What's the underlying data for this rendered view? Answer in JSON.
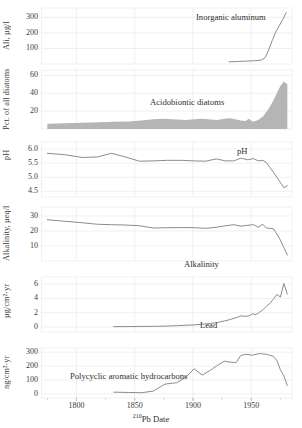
{
  "figure": {
    "xaxis_label_sup": "210",
    "xaxis_label_main": "Pb Date",
    "xlim": [
      1770,
      1985
    ],
    "xticks": [
      1800,
      1850,
      1900,
      1950
    ],
    "xtick_labels": [
      "1800",
      "1850",
      "1900",
      "1950"
    ],
    "grid_color": "#e6e6e6",
    "line_color": "#8c8c8c",
    "fill_color": "#b5b5b5",
    "text_color": "#3a3a3a"
  },
  "chart_data": [
    {
      "type": "line",
      "panel": 1,
      "title": "Inorganic aluminum",
      "ylabel_main": "Ali, ",
      "ylabel_unit": "µg/l",
      "ylabel": "Ali, µg/l",
      "xlabel": "",
      "ylim": [
        0,
        360
      ],
      "yticks": [
        100,
        200,
        300
      ],
      "ytick_labels": [
        "100",
        "200",
        "300"
      ],
      "grid": true,
      "x": [
        1931,
        1938,
        1944,
        1950,
        1955,
        1959,
        1962,
        1965,
        1968,
        1971,
        1974,
        1977,
        1980
      ],
      "values": [
        14,
        16,
        18,
        20,
        22,
        26,
        42,
        90,
        150,
        205,
        245,
        285,
        330
      ]
    },
    {
      "type": "area",
      "panel": 2,
      "title": "Acidobiontic diatoms",
      "ylabel": "Pct. of all diatoms",
      "xlabel": "",
      "ylim": [
        0,
        66
      ],
      "yticks": [
        20,
        40,
        60
      ],
      "ytick_labels": [
        "20",
        "40",
        "60"
      ],
      "grid": true,
      "x": [
        1775,
        1790,
        1805,
        1820,
        1832,
        1845,
        1856,
        1866,
        1876,
        1886,
        1894,
        1901,
        1908,
        1915,
        1921,
        1927,
        1932,
        1937,
        1941,
        1945,
        1948,
        1951,
        1954,
        1957,
        1960,
        1963,
        1966,
        1969,
        1972,
        1975,
        1978,
        1981
      ],
      "values": [
        6,
        6.5,
        7,
        7.5,
        8,
        8.5,
        9.5,
        11,
        11.5,
        10.5,
        10,
        11,
        11.5,
        10.5,
        10,
        11.5,
        12,
        10.5,
        9.5,
        9,
        11.5,
        8.5,
        9,
        11,
        14,
        19,
        25,
        32,
        40,
        48,
        53,
        50
      ]
    },
    {
      "type": "line",
      "panel": 3,
      "title": "pH",
      "ylabel": "pH",
      "xlabel": "",
      "ylim": [
        4.3,
        6.25
      ],
      "yticks": [
        4.5,
        5.0,
        5.5,
        6.0
      ],
      "ytick_labels": [
        "4.5",
        "5.0",
        "5.5",
        "6.0"
      ],
      "grid": true,
      "x": [
        1775,
        1790,
        1805,
        1818,
        1830,
        1842,
        1854,
        1866,
        1878,
        1890,
        1901,
        1911,
        1920,
        1928,
        1935,
        1941,
        1947,
        1952,
        1956,
        1960,
        1963,
        1966,
        1969,
        1972,
        1975,
        1978,
        1981
      ],
      "values": [
        5.85,
        5.8,
        5.7,
        5.72,
        5.85,
        5.72,
        5.57,
        5.58,
        5.6,
        5.6,
        5.58,
        5.57,
        5.65,
        5.58,
        5.58,
        5.68,
        5.62,
        5.66,
        5.58,
        5.6,
        5.52,
        5.35,
        5.18,
        5.0,
        4.82,
        4.63,
        4.7
      ]
    },
    {
      "type": "line",
      "panel": 4,
      "title": "Alkalinity",
      "ylabel_main": "Alkalinity, ",
      "ylabel_unit": "µeq/l",
      "ylabel": "Alkalinity, µeq/l",
      "xlabel": "",
      "ylim": [
        0,
        36
      ],
      "yticks": [
        10,
        20,
        30
      ],
      "ytick_labels": [
        "10",
        "20",
        "30"
      ],
      "grid": true,
      "x": [
        1775,
        1790,
        1805,
        1818,
        1830,
        1842,
        1854,
        1866,
        1878,
        1890,
        1901,
        1911,
        1920,
        1928,
        1935,
        1941,
        1947,
        1952,
        1956,
        1960,
        1963,
        1966,
        1969,
        1972,
        1975,
        1978,
        1981
      ],
      "values": [
        27.5,
        26.5,
        25.5,
        24.5,
        24.2,
        24.0,
        23.5,
        22.0,
        22.2,
        22.3,
        22.2,
        21.8,
        22.5,
        23.5,
        24.2,
        23.2,
        23.8,
        24.2,
        22.5,
        24.5,
        22.0,
        21.8,
        21.5,
        18.0,
        14.0,
        9.0,
        4.0
      ]
    },
    {
      "type": "line",
      "panel": 5,
      "title": "Lead",
      "ylabel_main": "",
      "ylabel_unit": "µg/cm²·yr",
      "ylabel": "µg/cm²·yr",
      "xlabel": "",
      "ylim": [
        -0.7,
        7.0
      ],
      "yticks": [
        0,
        2,
        4,
        6
      ],
      "ytick_labels": [
        "0",
        "2",
        "4",
        "6"
      ],
      "grid": true,
      "x": [
        1832,
        1845,
        1856,
        1866,
        1876,
        1886,
        1894,
        1901,
        1908,
        1915,
        1921,
        1927,
        1932,
        1937,
        1941,
        1945,
        1948,
        1951,
        1954,
        1957,
        1960,
        1963,
        1966,
        1969,
        1972,
        1975,
        1978,
        1981
      ],
      "values": [
        0.05,
        0.06,
        0.08,
        0.1,
        0.12,
        0.18,
        0.25,
        0.3,
        0.38,
        0.5,
        0.62,
        0.85,
        1.05,
        1.3,
        1.55,
        1.5,
        1.55,
        1.85,
        1.75,
        2.05,
        2.4,
        2.9,
        3.3,
        3.9,
        4.55,
        4.2,
        6.1,
        4.6
      ]
    },
    {
      "type": "line",
      "panel": 6,
      "title": "Polycyclic aromatic hydrocarbons",
      "ylabel_main": "",
      "ylabel_unit": "ng/cm²·yr",
      "ylabel": "ng/cm²·yr",
      "xlabel": "",
      "ylim": [
        -30,
        330
      ],
      "yticks": [
        0,
        100,
        200,
        300
      ],
      "ytick_labels": [
        "0",
        "100",
        "200",
        "300"
      ],
      "grid": true,
      "x": [
        1832,
        1845,
        1856,
        1866,
        1876,
        1886,
        1894,
        1901,
        1908,
        1915,
        1921,
        1927,
        1932,
        1937,
        1941,
        1945,
        1951,
        1957,
        1963,
        1969,
        1972,
        1975,
        1978,
        1981
      ],
      "values": [
        12,
        10,
        8,
        20,
        70,
        80,
        120,
        180,
        135,
        170,
        205,
        235,
        228,
        225,
        275,
        285,
        278,
        290,
        285,
        270,
        240,
        175,
        130,
        60
      ]
    }
  ]
}
